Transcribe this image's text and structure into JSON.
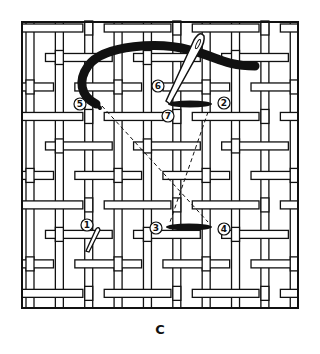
{
  "figure": {
    "caption": "C",
    "colors": {
      "ink": "#111111",
      "paper": "#ffffff",
      "strip": "#ffffff"
    },
    "grid": {
      "left": 22,
      "top": 22,
      "right": 298,
      "bottom": 308,
      "cell": 29.5
    },
    "markers": [
      {
        "id": "1",
        "label": "1",
        "x": 87,
        "y": 225
      },
      {
        "id": "2",
        "label": "2",
        "x": 224,
        "y": 103
      },
      {
        "id": "3",
        "label": "3",
        "x": 156,
        "y": 228
      },
      {
        "id": "4",
        "label": "4",
        "x": 224,
        "y": 229
      },
      {
        "id": "5",
        "label": "5",
        "x": 80,
        "y": 104
      },
      {
        "id": "6",
        "label": "6",
        "x": 158,
        "y": 86
      },
      {
        "id": "7",
        "label": "7",
        "x": 168,
        "y": 116
      }
    ],
    "stitches": [
      {
        "from": "7",
        "to": "2",
        "x1": 168,
        "y1": 104,
        "x2": 212,
        "y2": 104
      },
      {
        "from": "3",
        "to": "4",
        "x1": 166,
        "y1": 227,
        "x2": 212,
        "y2": 227
      }
    ],
    "dashed_paths": [
      {
        "from": "5",
        "to": "4",
        "x1": 102,
        "y1": 106,
        "x2": 208,
        "y2": 222
      },
      {
        "from": "2",
        "to": "3",
        "x1": 208,
        "y1": 112,
        "x2": 170,
        "y2": 222
      }
    ],
    "needles": [
      {
        "name": "large-needle",
        "x1": 200,
        "y1": 38,
        "x2": 168,
        "y2": 100
      },
      {
        "name": "small-needle",
        "x1": 98,
        "y1": 228,
        "x2": 88,
        "y2": 250
      }
    ]
  }
}
